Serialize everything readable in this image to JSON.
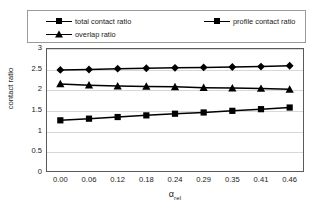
{
  "chart_data": {
    "type": "line",
    "title": "",
    "xlabel": "α rel",
    "xlabel_base": "α",
    "xlabel_sub": "rel",
    "ylabel": "contact ratio",
    "categories": [
      "0.00",
      "0.06",
      "0.12",
      "0.18",
      "0.24",
      "0.29",
      "0.35",
      "0.41",
      "0.46"
    ],
    "ylim": [
      0,
      3
    ],
    "yticks": [
      "0",
      "0.5",
      "1",
      "1.5",
      "2",
      "2.5",
      "3"
    ],
    "ytick_values": [
      0,
      0.5,
      1,
      1.5,
      2,
      2.5,
      3
    ],
    "grid": true,
    "legend_position": "top",
    "series": [
      {
        "name": "total contact ratio",
        "marker": "diamond",
        "color": "#000000",
        "values": [
          2.47,
          2.48,
          2.5,
          2.51,
          2.52,
          2.53,
          2.54,
          2.55,
          2.57
        ]
      },
      {
        "name": "profile contact ratio",
        "marker": "square",
        "color": "#000000",
        "values": [
          1.25,
          1.29,
          1.33,
          1.37,
          1.41,
          1.44,
          1.48,
          1.52,
          1.56
        ]
      },
      {
        "name": "overlap ratio",
        "marker": "triangle",
        "color": "#000000",
        "values": [
          2.13,
          2.1,
          2.08,
          2.07,
          2.06,
          2.04,
          2.03,
          2.02,
          2.0
        ]
      }
    ]
  },
  "legend": {
    "items": [
      {
        "label": "total contact ratio",
        "marker": "diamond"
      },
      {
        "label": "profile contact ratio",
        "marker": "square"
      },
      {
        "label": "overlap ratio",
        "marker": "triangle"
      }
    ]
  }
}
